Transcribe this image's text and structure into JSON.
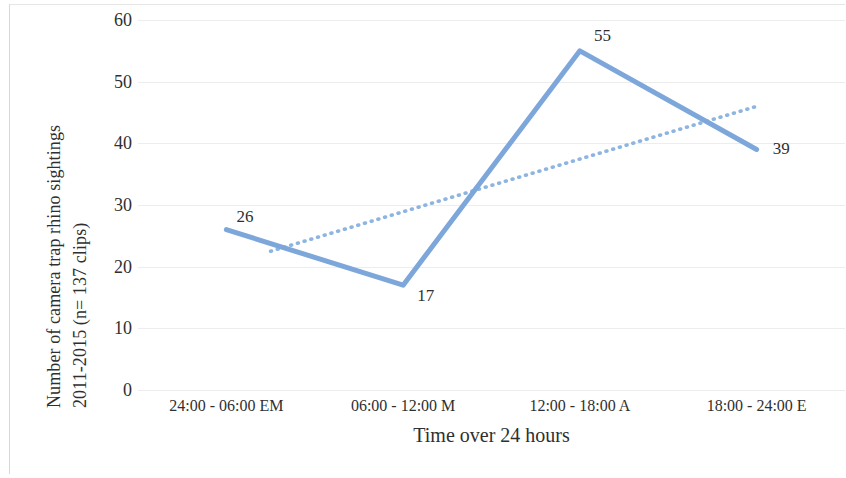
{
  "chart_data": {
    "type": "line",
    "title": "",
    "xlabel": "Time over 24 hours",
    "ylabel_line1": "Number of camera trap rhino sightings",
    "ylabel_line2": "2011-2015 (n= 137 clips)",
    "categories": [
      "24:00 - 06:00 EM",
      "06:00 - 12:00 M",
      "12:00 - 18:00 A",
      "18:00 - 24:00 E"
    ],
    "values": [
      26,
      17,
      55,
      39
    ],
    "point_labels": [
      "26",
      "17",
      "55",
      "39"
    ],
    "ylim": [
      0,
      60
    ],
    "ytick_labels": [
      "60",
      "50",
      "40",
      "30",
      "20",
      "10",
      "0"
    ],
    "ytick_values": [
      60,
      50,
      40,
      30,
      20,
      10,
      0
    ],
    "grid": true,
    "legend": "none",
    "series": [
      {
        "name": "Sightings",
        "style": "solid",
        "color": "#7DA7DB",
        "values": [
          26,
          17,
          55,
          39
        ]
      },
      {
        "name": "Linear trendline",
        "style": "dotted",
        "color": "#8EB4E0",
        "endpoints": [
          {
            "x_index": 0.25,
            "y": 22.5
          },
          {
            "x_index": 3.0,
            "y": 46.0
          }
        ]
      }
    ],
    "colors": {
      "line": "#7DA7DB",
      "trendline": "#8EB4E0",
      "grid": "#ededed",
      "text": "#2f2f2f",
      "background": "#ffffff"
    }
  }
}
